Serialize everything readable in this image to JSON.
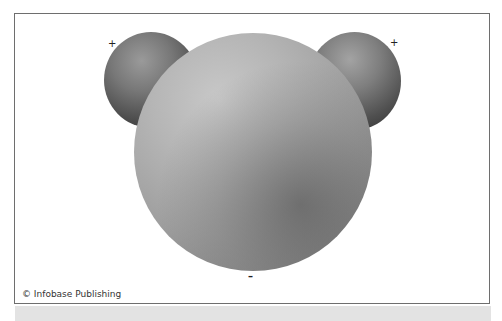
{
  "diagram": {
    "atoms": [
      {
        "name": "hydrogen-left",
        "charge_label": "+"
      },
      {
        "name": "oxygen",
        "charge_label": "–"
      },
      {
        "name": "hydrogen-right",
        "charge_label": "+"
      }
    ],
    "labels": {
      "plus_left": "+",
      "plus_right": "+",
      "minus": "–"
    },
    "credit": "© Infobase Publishing",
    "colors": {
      "frame_border": "#6e6e6e",
      "band": "#e3e3e3",
      "oxygen_highlight": "#c8c8c8",
      "hydrogen_shadow": "#333333"
    }
  }
}
